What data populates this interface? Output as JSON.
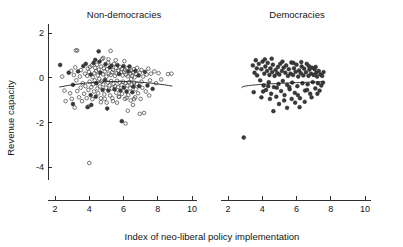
{
  "chart_data": {
    "type": "scatter",
    "title": "",
    "xlabel": "Index of neo-liberal policy implementation",
    "ylabel": "Revenue capacity",
    "xlim": [
      1.6,
      10.6
    ],
    "ylim": [
      -4.6,
      2.4
    ],
    "xticks": [
      2,
      4,
      6,
      8,
      10
    ],
    "yticks": [
      2,
      0,
      -2,
      -4
    ],
    "grid": false,
    "legend": "none",
    "panels": [
      {
        "name": "non-democracies",
        "label": "Non-democracies",
        "marker_styles": [
          "open-circle",
          "filled-circle"
        ],
        "fit_curve": {
          "shape": "concave-quadratic",
          "x_start": 2.25,
          "x_end": 8.85,
          "y_start": -0.42,
          "y_peak": -0.17,
          "x_peak": 5.7,
          "y_end": -0.48
        },
        "points": [
          [
            2.3,
            0.57
          ],
          [
            2.55,
            -0.58
          ],
          [
            2.62,
            -1.05
          ],
          [
            2.8,
            0.22
          ],
          [
            2.88,
            -0.7
          ],
          [
            2.95,
            0.3
          ],
          [
            2.98,
            -0.95
          ],
          [
            3.05,
            -0.32
          ],
          [
            3.1,
            0.12
          ],
          [
            3.15,
            -1.34
          ],
          [
            3.18,
            0.46
          ],
          [
            3.22,
            1.22
          ],
          [
            3.25,
            -0.12
          ],
          [
            3.3,
            -0.6
          ],
          [
            3.35,
            0.28
          ],
          [
            3.4,
            -0.88
          ],
          [
            3.45,
            0.05
          ],
          [
            3.5,
            -0.45
          ],
          [
            3.52,
            0.34
          ],
          [
            3.58,
            -1.05
          ],
          [
            3.62,
            -0.25
          ],
          [
            3.65,
            0.52
          ],
          [
            3.7,
            -0.72
          ],
          [
            3.75,
            0.18
          ],
          [
            3.78,
            -0.38
          ],
          [
            3.8,
            0.62
          ],
          [
            3.85,
            -0.92
          ],
          [
            3.88,
            0.08
          ],
          [
            3.9,
            -1.32
          ],
          [
            3.92,
            0.4
          ],
          [
            3.95,
            -0.55
          ],
          [
            3.98,
            0.26
          ],
          [
            4.0,
            -3.82
          ],
          [
            4.02,
            -0.18
          ],
          [
            4.05,
            0.48
          ],
          [
            4.08,
            -0.78
          ],
          [
            4.1,
            0.14
          ],
          [
            4.12,
            -0.42
          ],
          [
            4.15,
            0.55
          ],
          [
            4.18,
            -0.96
          ],
          [
            4.2,
            0.02
          ],
          [
            4.22,
            -0.3
          ],
          [
            4.25,
            0.66
          ],
          [
            4.28,
            -0.62
          ],
          [
            4.3,
            0.2
          ],
          [
            4.32,
            -0.12
          ],
          [
            4.35,
            0.44
          ],
          [
            4.38,
            -0.85
          ],
          [
            4.4,
            0.3
          ],
          [
            4.42,
            -0.25
          ],
          [
            4.45,
            0.58
          ],
          [
            4.48,
            -0.48
          ],
          [
            4.5,
            0.1
          ],
          [
            4.52,
            -0.7
          ],
          [
            4.55,
            0.36
          ],
          [
            4.58,
            -0.05
          ],
          [
            4.6,
            0.72
          ],
          [
            4.62,
            -0.4
          ],
          [
            4.65,
            0.22
          ],
          [
            4.68,
            -0.92
          ],
          [
            4.7,
            0.5
          ],
          [
            4.72,
            -0.18
          ],
          [
            4.75,
            0.84
          ],
          [
            4.78,
            -0.55
          ],
          [
            4.8,
            0.15
          ],
          [
            4.82,
            -0.3
          ],
          [
            4.85,
            0.42
          ],
          [
            4.88,
            -0.75
          ],
          [
            4.9,
            0.28
          ],
          [
            4.92,
            -0.1
          ],
          [
            4.95,
            0.6
          ],
          [
            4.98,
            -0.45
          ],
          [
            5.0,
            0.05
          ],
          [
            5.02,
            -1.12
          ],
          [
            5.05,
            0.38
          ],
          [
            5.08,
            -0.22
          ],
          [
            5.1,
            0.68
          ],
          [
            5.12,
            -0.58
          ],
          [
            5.15,
            0.18
          ],
          [
            5.18,
            -0.35
          ],
          [
            5.2,
            0.46
          ],
          [
            5.22,
            -0.8
          ],
          [
            5.25,
            0.12
          ],
          [
            5.28,
            -0.15
          ],
          [
            5.3,
            0.54
          ],
          [
            5.32,
            -0.48
          ],
          [
            5.35,
            0.25
          ],
          [
            5.38,
            -1.05
          ],
          [
            5.4,
            0.35
          ],
          [
            5.42,
            -0.28
          ],
          [
            5.45,
            0.62
          ],
          [
            5.48,
            -0.52
          ],
          [
            5.5,
            0.08
          ],
          [
            5.52,
            -0.38
          ],
          [
            5.55,
            0.44
          ],
          [
            5.58,
            -0.68
          ],
          [
            5.6,
            0.2
          ],
          [
            5.62,
            -0.14
          ],
          [
            5.65,
            0.56
          ],
          [
            5.68,
            -0.42
          ],
          [
            5.7,
            0.3
          ],
          [
            5.72,
            -0.85
          ],
          [
            5.75,
            0.16
          ],
          [
            5.78,
            -0.22
          ],
          [
            5.8,
            0.48
          ],
          [
            5.82,
            -0.58
          ],
          [
            5.85,
            0.24
          ],
          [
            5.88,
            -0.32
          ],
          [
            5.9,
            0.4
          ],
          [
            5.92,
            -0.72
          ],
          [
            5.95,
            0.1
          ],
          [
            5.98,
            -0.18
          ],
          [
            6.0,
            0.52
          ],
          [
            6.02,
            -0.45
          ],
          [
            6.05,
            0.26
          ],
          [
            6.08,
            -0.95
          ],
          [
            6.1,
            0.34
          ],
          [
            6.12,
            -0.25
          ],
          [
            6.15,
            0.14
          ],
          [
            6.18,
            -0.62
          ],
          [
            6.2,
            0.42
          ],
          [
            6.22,
            -0.35
          ],
          [
            6.25,
            0.06
          ],
          [
            6.28,
            -0.78
          ],
          [
            6.3,
            0.28
          ],
          [
            6.32,
            -0.2
          ],
          [
            6.35,
            0.5
          ],
          [
            6.38,
            -0.48
          ],
          [
            6.4,
            0.18
          ],
          [
            6.42,
            -1.02
          ],
          [
            6.45,
            0.32
          ],
          [
            6.48,
            -0.3
          ],
          [
            6.5,
            0.08
          ],
          [
            6.52,
            -0.65
          ],
          [
            6.55,
            0.24
          ],
          [
            6.58,
            -0.4
          ],
          [
            6.6,
            0.38
          ],
          [
            6.62,
            -0.22
          ],
          [
            6.65,
            0.02
          ],
          [
            6.68,
            -0.88
          ],
          [
            6.7,
            0.3
          ],
          [
            6.72,
            -0.52
          ],
          [
            6.75,
            0.16
          ],
          [
            6.78,
            -0.28
          ],
          [
            6.8,
            0.44
          ],
          [
            6.85,
            -0.7
          ],
          [
            6.88,
            0.1
          ],
          [
            6.92,
            -0.38
          ],
          [
            6.95,
            0.22
          ],
          [
            7.0,
            -0.95
          ],
          [
            7.05,
            0.34
          ],
          [
            7.1,
            -0.45
          ],
          [
            7.15,
            0.05
          ],
          [
            7.2,
            -1.58
          ],
          [
            7.25,
            0.26
          ],
          [
            7.3,
            -0.62
          ],
          [
            7.35,
            0.14
          ],
          [
            7.4,
            -0.35
          ],
          [
            7.45,
            0.4
          ],
          [
            7.5,
            -0.8
          ],
          [
            7.6,
            0.18
          ],
          [
            7.7,
            -0.5
          ],
          [
            7.8,
            0.28
          ],
          [
            7.9,
            -0.25
          ],
          [
            8.05,
            0.2
          ],
          [
            8.2,
            -0.08
          ],
          [
            8.6,
            0.16
          ],
          [
            8.8,
            0.18
          ],
          [
            4.55,
            1.18
          ],
          [
            5.25,
            1.2
          ],
          [
            3.3,
            1.22
          ],
          [
            4.82,
            0.88
          ],
          [
            5.12,
            0.82
          ],
          [
            5.55,
            0.78
          ],
          [
            6.05,
            0.74
          ],
          [
            4.35,
            0.8
          ],
          [
            6.25,
            -1.48
          ],
          [
            5.62,
            -1.12
          ],
          [
            4.68,
            -1.1
          ],
          [
            5.9,
            -1.95
          ],
          [
            6.12,
            -2.05
          ],
          [
            6.95,
            -1.62
          ],
          [
            5.05,
            -1.38
          ],
          [
            3.95,
            -1.3
          ],
          [
            6.55,
            -1.22
          ],
          [
            7.05,
            -0.18
          ],
          [
            6.45,
            -0.06
          ],
          [
            7.55,
            -0.12
          ],
          [
            2.42,
            0.05
          ],
          [
            3.05,
            -1.18
          ],
          [
            4.12,
            -1.22
          ],
          [
            4.9,
            -0.95
          ],
          [
            5.35,
            -0.92
          ],
          [
            5.75,
            -0.86
          ],
          [
            6.18,
            -0.9
          ],
          [
            6.62,
            -0.96
          ]
        ]
      },
      {
        "name": "democracies",
        "label": "Democracies",
        "marker_styles": [
          "filled-circle"
        ],
        "fit_curve": {
          "shape": "rising-flattening",
          "x_start": 2.8,
          "x_end": 7.6,
          "y_start": -0.45,
          "y_end": -0.18
        },
        "points": [
          [
            2.92,
            -2.68
          ],
          [
            3.45,
            0.55
          ],
          [
            3.55,
            0.22
          ],
          [
            3.62,
            0.78
          ],
          [
            3.7,
            0.1
          ],
          [
            3.8,
            0.62
          ],
          [
            3.88,
            -0.12
          ],
          [
            3.95,
            0.38
          ],
          [
            4.02,
            0.72
          ],
          [
            4.08,
            -0.35
          ],
          [
            4.12,
            0.18
          ],
          [
            4.18,
            0.5
          ],
          [
            4.22,
            -0.55
          ],
          [
            4.28,
            0.3
          ],
          [
            4.32,
            0.66
          ],
          [
            4.38,
            -0.2
          ],
          [
            4.42,
            0.12
          ],
          [
            4.48,
            0.42
          ],
          [
            4.52,
            -0.72
          ],
          [
            4.58,
            0.25
          ],
          [
            4.62,
            0.58
          ],
          [
            4.65,
            -1.5
          ],
          [
            4.68,
            -0.42
          ],
          [
            4.72,
            0.08
          ],
          [
            4.78,
            0.35
          ],
          [
            4.82,
            -0.85
          ],
          [
            4.88,
            0.2
          ],
          [
            4.92,
            0.48
          ],
          [
            4.95,
            -0.28
          ],
          [
            5.0,
            0.14
          ],
          [
            5.05,
            0.62
          ],
          [
            5.1,
            -0.6
          ],
          [
            5.15,
            0.3
          ],
          [
            5.2,
            -0.15
          ],
          [
            5.25,
            0.45
          ],
          [
            5.3,
            -0.78
          ],
          [
            5.35,
            0.22
          ],
          [
            5.4,
            0.55
          ],
          [
            5.45,
            -0.32
          ],
          [
            5.5,
            0.08
          ],
          [
            5.55,
            0.38
          ],
          [
            5.6,
            -0.52
          ],
          [
            5.65,
            0.18
          ],
          [
            5.7,
            0.68
          ],
          [
            5.75,
            -0.22
          ],
          [
            5.8,
            0.12
          ],
          [
            5.85,
            0.42
          ],
          [
            5.9,
            -0.68
          ],
          [
            5.95,
            0.26
          ],
          [
            6.0,
            0.58
          ],
          [
            6.05,
            -0.38
          ],
          [
            6.1,
            0.05
          ],
          [
            6.15,
            0.32
          ],
          [
            6.2,
            -0.92
          ],
          [
            6.25,
            0.2
          ],
          [
            6.3,
            0.5
          ],
          [
            6.35,
            -0.25
          ],
          [
            6.4,
            0.1
          ],
          [
            6.45,
            0.4
          ],
          [
            6.5,
            -0.58
          ],
          [
            6.55,
            0.24
          ],
          [
            6.6,
            0.62
          ],
          [
            6.65,
            -0.3
          ],
          [
            6.7,
            0.08
          ],
          [
            6.75,
            0.36
          ],
          [
            6.8,
            -0.72
          ],
          [
            6.85,
            0.18
          ],
          [
            6.9,
            0.45
          ],
          [
            6.95,
            -0.2
          ],
          [
            7.0,
            0.12
          ],
          [
            7.05,
            0.38
          ],
          [
            7.1,
            -0.48
          ],
          [
            7.15,
            0.22
          ],
          [
            7.2,
            0.05
          ],
          [
            7.25,
            -0.25
          ],
          [
            7.3,
            0.3
          ],
          [
            7.35,
            -0.58
          ],
          [
            7.4,
            0.15
          ],
          [
            7.45,
            -0.35
          ],
          [
            7.5,
            0.08
          ],
          [
            7.55,
            -0.22
          ],
          [
            7.58,
            0.25
          ],
          [
            3.5,
            -0.65
          ],
          [
            3.95,
            -0.88
          ],
          [
            4.45,
            -0.95
          ],
          [
            4.85,
            -0.45
          ],
          [
            5.28,
            -1.02
          ],
          [
            5.72,
            -0.95
          ],
          [
            6.08,
            -0.78
          ],
          [
            6.48,
            -1.08
          ],
          [
            6.88,
            -0.88
          ],
          [
            7.22,
            -0.72
          ],
          [
            4.05,
            -0.62
          ],
          [
            4.35,
            -0.38
          ],
          [
            5.58,
            -0.42
          ],
          [
            6.62,
            -0.55
          ],
          [
            3.68,
            0.42
          ],
          [
            4.15,
            0.82
          ],
          [
            4.55,
            0.85
          ],
          [
            5.18,
            0.72
          ],
          [
            5.82,
            0.66
          ],
          [
            6.28,
            0.7
          ],
          [
            6.72,
            0.52
          ],
          [
            7.12,
            0.48
          ],
          [
            5.45,
            -1.35
          ],
          [
            6.18,
            -1.32
          ],
          [
            4.98,
            -1.18
          ],
          [
            5.92,
            -1.12
          ]
        ]
      }
    ]
  }
}
